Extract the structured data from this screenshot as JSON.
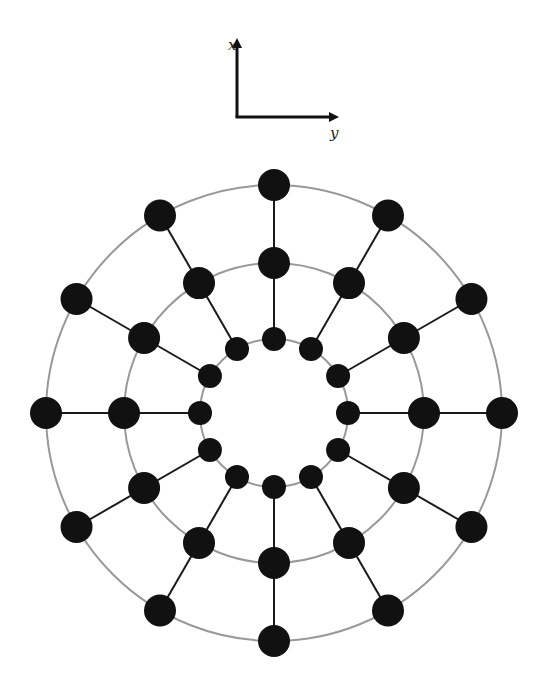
{
  "axes": {
    "origin": [
      237,
      117
    ],
    "x_axis": {
      "label": "x",
      "tip": [
        237,
        36
      ],
      "label_pos": [
        228,
        50
      ]
    },
    "y_axis": {
      "label": "y",
      "tip": [
        341,
        117
      ],
      "label_pos": [
        330,
        138
      ]
    },
    "color": "#111111"
  },
  "network": {
    "center": [
      274,
      413
    ],
    "spokes": 12,
    "start_angle_deg": -90,
    "rings": [
      {
        "name": "inner",
        "radius": 74,
        "node_radius": 12
      },
      {
        "name": "middle",
        "radius": 150,
        "node_radius": 16
      },
      {
        "name": "outer",
        "radius": 228,
        "node_radius": 16
      }
    ],
    "ring_stroke": "#999999",
    "ring_stroke_width": 2,
    "spoke_stroke": "#1a1a1a",
    "spoke_stroke_width": 2,
    "node_fill": "#111111"
  }
}
